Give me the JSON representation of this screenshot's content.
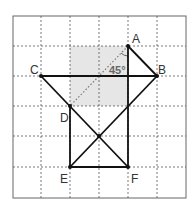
{
  "diagram": {
    "grid": {
      "cols": 6,
      "rows": 6
    },
    "points": {
      "A": {
        "label": "A"
      },
      "B": {
        "label": "B"
      },
      "C": {
        "label": "C"
      },
      "D": {
        "label": "D"
      },
      "E": {
        "label": "E"
      },
      "F": {
        "label": "F"
      }
    },
    "angle_label": "45°",
    "segments": [
      "A-B",
      "C-B",
      "C-F",
      "B-E",
      "D-E",
      "E-F",
      "A-F"
    ],
    "dotted_segments": [
      "A-D"
    ],
    "shaded_region": "2×2 grid square between D and A"
  }
}
